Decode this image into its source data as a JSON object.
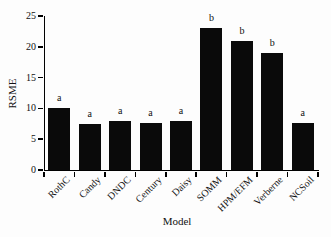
{
  "chart_data": {
    "type": "bar",
    "title": "",
    "xlabel": "Model",
    "ylabel": "RSME",
    "categories": [
      "RothC",
      "Candy",
      "DNDC",
      "Century",
      "Daisy",
      "SOMM",
      "HPM/EFM",
      "Verberne",
      "NCSoil"
    ],
    "values": [
      10,
      7.5,
      8,
      7.7,
      8,
      23,
      21,
      19,
      7.7
    ],
    "bar_annotations": [
      "a",
      "a",
      "a",
      "a",
      "a",
      "b",
      "b",
      "b",
      "a"
    ],
    "ylim": [
      0,
      25
    ],
    "yticks": [
      0,
      5,
      10,
      15,
      20,
      25
    ],
    "bar_color": "#0a0a0a",
    "background_color": "#fdfdfd",
    "grid": false,
    "legend": null
  }
}
